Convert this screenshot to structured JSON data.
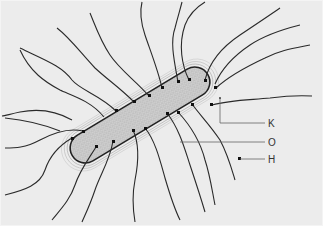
{
  "diagram": {
    "background": "#ececec",
    "labels": [
      {
        "id": "K",
        "text": "K"
      },
      {
        "id": "O",
        "text": "O"
      },
      {
        "id": "H",
        "text": "H"
      }
    ],
    "colors": {
      "line": "#2a2a2a",
      "cell_fill": "#c8c8c8",
      "leader": "#666666"
    }
  }
}
